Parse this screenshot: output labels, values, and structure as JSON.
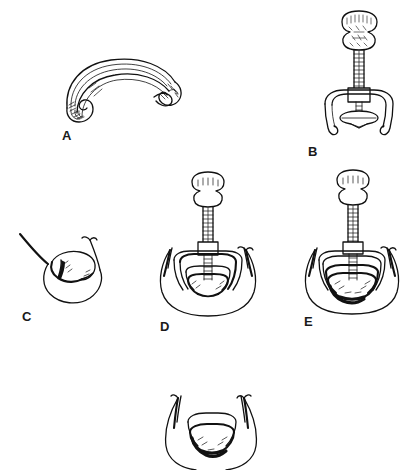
{
  "figure": {
    "background_color": "#ffffff",
    "ink_color": "#111111",
    "style": "black-and-white line drawing",
    "width": 413,
    "height": 467,
    "panel_count": 6
  },
  "panels": [
    {
      "id": "A",
      "label": "A",
      "label_x": 62,
      "label_y": 129,
      "caption": "",
      "subject": "curved inflatable cuff ring, oblique view with hatched ends",
      "x": 60,
      "y": 55,
      "width": 120,
      "height": 65
    },
    {
      "id": "B",
      "label": "B",
      "label_x": 308,
      "label_y": 145,
      "caption": "",
      "subject": "device with mushroom handle, graduated shaft, U-shaped hooked prongs and oval disc",
      "x": 315,
      "y": 10,
      "width": 85,
      "height": 130
    },
    {
      "id": "C",
      "label": "C",
      "label_x": 22,
      "label_y": 310,
      "caption": "",
      "subject": "anatomical outline of oral cavity and tongue, empty",
      "x": 15,
      "y": 230,
      "width": 105,
      "height": 75
    },
    {
      "id": "D",
      "label": "D",
      "label_x": 160,
      "label_y": 320,
      "caption": "",
      "subject": "device inserted into anatomy, prongs open, cuff visible",
      "x": 150,
      "y": 170,
      "width": 120,
      "height": 145
    },
    {
      "id": "E",
      "label": "E",
      "label_x": 304,
      "label_y": 315,
      "caption": "",
      "subject": "device in anatomy with cuff collapsed and retracted, stacked arcs",
      "x": 295,
      "y": 168,
      "width": 115,
      "height": 143
    },
    {
      "id": "F",
      "label": "",
      "label_x": 0,
      "label_y": 0,
      "caption": "",
      "subject": "final seated cuff within anatomy, device removed, cropped at image edge",
      "x": 150,
      "y": 390,
      "width": 120,
      "height": 77
    }
  ]
}
